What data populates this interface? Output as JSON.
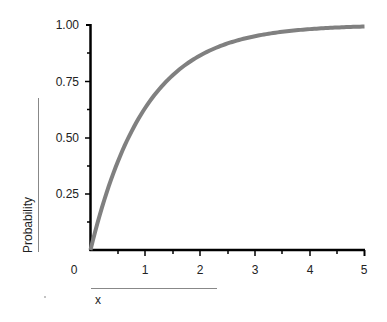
{
  "chart_data": {
    "type": "line",
    "title": "",
    "xlabel": "x",
    "ylabel": "Probability",
    "xlim": [
      0,
      5
    ],
    "ylim": [
      0,
      1
    ],
    "grid": false,
    "legend": null,
    "x_ticks": [
      "0",
      "1",
      "2",
      "3",
      "4",
      "5"
    ],
    "y_ticks": [
      "0.25",
      "0.50",
      "0.75",
      "1.00"
    ],
    "series": [
      {
        "name": "CDF",
        "color": "#808080",
        "x": [
          0,
          0.25,
          0.5,
          0.75,
          1.0,
          1.25,
          1.5,
          1.75,
          2.0,
          2.5,
          3.0,
          3.5,
          4.0,
          4.5,
          5.0
        ],
        "y": [
          0,
          0.22,
          0.39,
          0.53,
          0.63,
          0.71,
          0.78,
          0.83,
          0.86,
          0.92,
          0.95,
          0.97,
          0.98,
          0.99,
          0.99
        ]
      }
    ]
  },
  "labels": {
    "x_title": "x",
    "y_title": "Probability",
    "x_ticks": [
      "0",
      "1",
      "2",
      "3",
      "4",
      "5"
    ],
    "y_ticks": [
      "0.25",
      "0.50",
      "0.75",
      "1.00"
    ]
  }
}
